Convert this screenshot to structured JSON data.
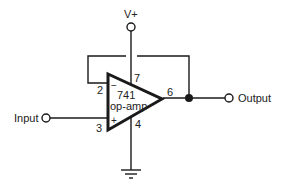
{
  "diagram": {
    "component": {
      "name": "741",
      "type": "op-amp"
    },
    "pins": {
      "inverting": "2",
      "non_inverting": "3",
      "output": "6",
      "v_plus": "7",
      "v_minus": "4"
    },
    "signs": {
      "minus": "−",
      "plus": "+"
    },
    "labels": {
      "supply": "V+",
      "input": "Input",
      "output": "Output"
    },
    "colors": {
      "line": "#1a1a1a",
      "background": "#ffffff"
    }
  }
}
